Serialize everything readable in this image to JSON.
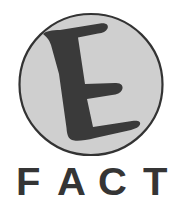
{
  "logo": {
    "emblem": {
      "letter": "E",
      "circle_fill": "#cfcfcf",
      "circle_stroke": "#333333",
      "letter_fill": "#3a3a3a"
    },
    "wordmark": {
      "text": "FACT",
      "letters": [
        "F",
        "A",
        "C",
        "T"
      ],
      "color": "#353535"
    }
  }
}
